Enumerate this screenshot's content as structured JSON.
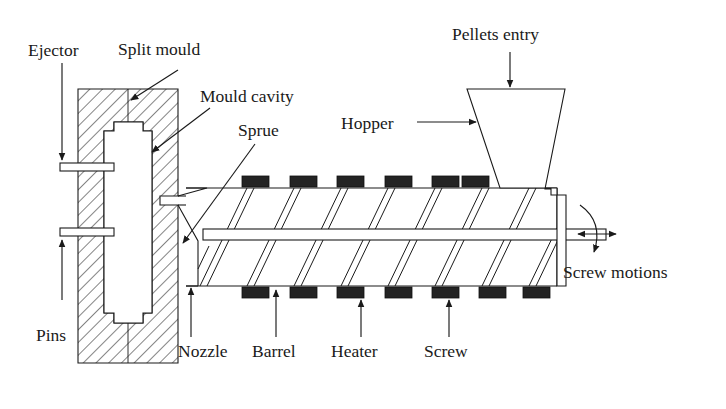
{
  "figure": {
    "background_color": "#ffffff",
    "line_color": "#1a1a1a",
    "heater_color": "#232323",
    "width": 726,
    "height": 409
  },
  "labels": {
    "ejector": "Ejector",
    "split_mould": "Split mould",
    "mould_cavity": "Mould cavity",
    "sprue": "Sprue",
    "hopper": "Hopper",
    "pellets_entry": "Pellets entry",
    "screw_motions": "Screw motions",
    "pins": "Pins",
    "nozzle": "Nozzle",
    "barrel": "Barrel",
    "heater": "Heater",
    "screw": "Screw"
  },
  "components": {
    "mould": {
      "name": "Split mould",
      "hatched": true,
      "outer_x": 78,
      "outer_y": 89,
      "outer_w": 100,
      "outer_h": 274
    },
    "cavity": {
      "name": "Mould cavity",
      "filled": "white"
    },
    "ejector_pins": {
      "name": "Pins",
      "count": 2
    },
    "nozzle": {
      "name": "Nozzle"
    },
    "sprue": {
      "name": "Sprue"
    },
    "barrel": {
      "name": "Barrel",
      "left_x": 186,
      "right_x": 557,
      "top_y": 188,
      "bottom_y": 286
    },
    "heaters": {
      "name": "Heater",
      "top_count": 7,
      "bottom_count": 7,
      "block_width": 26,
      "block_height": 11
    },
    "screw": {
      "name": "Screw",
      "flight_count": 7,
      "shaft_top_y": 229,
      "shaft_bottom_y": 240
    },
    "hopper": {
      "name": "Hopper",
      "top_left_x": 467,
      "top_right_x": 565,
      "top_y": 89,
      "bottom_y": 189
    }
  },
  "annotations": {
    "pellets_entry_arrow": "down-arrow",
    "hopper_arrow": "right-arrow",
    "ejector_arrow": "down-arrow",
    "pins_arrow": "up-arrow",
    "screw_rotation_arrow": "curved-rotation-arrow",
    "screw_translation_arrow": "double-headed-horizontal-arrow"
  }
}
